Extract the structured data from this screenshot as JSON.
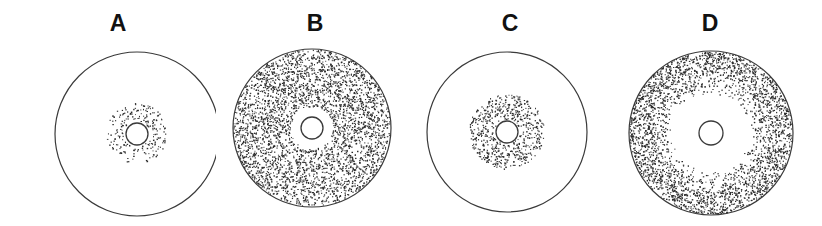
{
  "figure": {
    "type": "scientific-figure-stipple-circles",
    "background_color": "#ffffff",
    "stroke_color": "#3a3a3a",
    "stipple_color": "#2b2b2b",
    "label_color": "#111111",
    "width": 822,
    "height": 226,
    "panels": [
      {
        "label": "A",
        "name": "panel-a",
        "left": 20,
        "width": 196,
        "center_x": 117,
        "center_y": 134,
        "outer_radius": 82,
        "outer_filled": false,
        "hole_radius": 11,
        "stipple_inner_radius": 13,
        "stipple_outer_radius": 31,
        "stipple_count": 210,
        "stipple_density": "sparse",
        "description": "large empty circle with small sparse stippled annulus around central hole"
      },
      {
        "label": "B",
        "name": "panel-b",
        "left": 222,
        "width": 186,
        "center_x": 90,
        "center_y": 128,
        "outer_radius": 79,
        "outer_filled": true,
        "hole_radius": 11,
        "clear_radius": 21,
        "stipple_inner_radius": 21,
        "stipple_outer_radius": 79,
        "stipple_count": 3400,
        "stipple_density": "dense",
        "description": "fully stippled disc with narrow clear ring around central hole"
      },
      {
        "label": "C",
        "name": "panel-c",
        "left": 414,
        "width": 192,
        "center_x": 93,
        "center_y": 132,
        "outer_radius": 80,
        "outer_filled": false,
        "hole_radius": 11,
        "stipple_inner_radius": 12,
        "stipple_outer_radius": 38,
        "stipple_count": 620,
        "stipple_density": "medium",
        "description": "large empty circle with wider denser stippled annulus around central hole"
      },
      {
        "label": "D",
        "name": "panel-d",
        "left": 612,
        "width": 196,
        "center_x": 99,
        "center_y": 133,
        "outer_radius": 82,
        "outer_filled": true,
        "hole_radius": 12,
        "clear_radius": 39,
        "stipple_inner_radius": 39,
        "stipple_outer_radius": 82,
        "stipple_count": 3000,
        "stipple_density": "dense-graded",
        "description": "stippled disc with large clear annulus around central hole, density fading inward"
      }
    ]
  }
}
